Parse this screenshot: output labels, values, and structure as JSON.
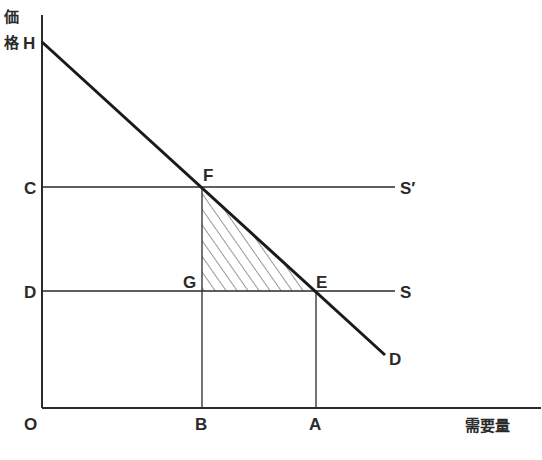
{
  "diagram": {
    "title": "",
    "y_axis_label": [
      "価",
      "格"
    ],
    "x_axis_label": "需要量",
    "origin_label": "O",
    "points": {
      "H": "H",
      "C": "C",
      "D_price": "D",
      "F": "F",
      "G": "G",
      "E": "E",
      "B": "B",
      "A": "A"
    },
    "curves": {
      "demand": "D",
      "supply": "S",
      "supply_shifted": "S′"
    },
    "shaded_region": "triangle F-G-E (hatched)",
    "colors": {
      "line": "#2a2a2a",
      "background": "#ffffff"
    }
  }
}
